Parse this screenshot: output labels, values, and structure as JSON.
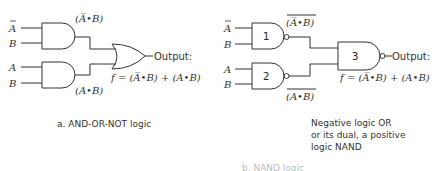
{
  "diagram_a": {
    "inputs": [
      {
        "label": "A",
        "negated": true
      },
      {
        "label": "B",
        "negated": false
      },
      {
        "label": "A",
        "negated": false
      },
      {
        "label": "B",
        "negated": false
      }
    ],
    "gate1_output_label": "(A̅•B)",
    "gate2_output_label": "(A•B)",
    "output_label": "Output:",
    "equation": "f = (A̅•B) + (A•B)",
    "caption": "a. AND-OR-NOT logic"
  },
  "diagram_b": {
    "inputs": [
      {
        "label": "A",
        "negated": true
      },
      {
        "label": "B",
        "negated": false
      },
      {
        "label": "A",
        "negated": false
      },
      {
        "label": "B",
        "negated": false
      }
    ],
    "gate_numbers": [
      "1",
      "2",
      "3"
    ],
    "gate1_output_label": "(A̅•B)",
    "gate2_output_label": "(A•B)",
    "output_label": "Output:",
    "equation": "f = (A̅•B) + (A•B)",
    "caption_lines": [
      "Negative logic OR",
      "or its dual, a  positive",
      "logic NAND"
    ],
    "cut_off_caption": "b. NAND logic"
  }
}
